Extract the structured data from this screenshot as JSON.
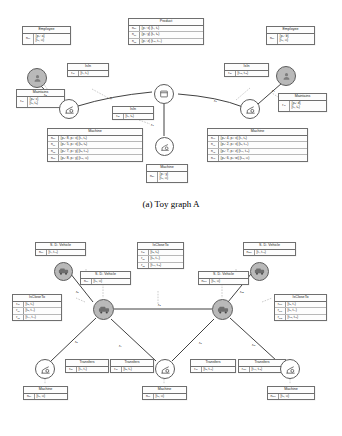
{
  "figure": {
    "caption_a": "(a) Toy graph A",
    "caption_b": "(b) Toy graph B"
  },
  "panel_a": {
    "boxes": {
      "employee_left": {
        "title": "Employee",
        "rows": [
          {
            "key_n": "n",
            "key_sub": "0",
            "key_sup": "0",
            "val": "{p₂: a}",
            "val2": "[t₀, ∞)"
          }
        ]
      },
      "product": {
        "title": "Product",
        "rows": [
          {
            "key_n": "n",
            "key_sub": "3",
            "key_sup": "0",
            "val": "{p₁: x} [t₁, t₇)"
          },
          {
            "key_n": "n",
            "key_sub": "3",
            "key_sup": "1",
            "val": "{p₁: y} [t₇, t₈)"
          },
          {
            "key_n": "n",
            "key_sub": "3",
            "key_sup": "2",
            "val": "{p₁: z} [t₁₃, t₁₄)"
          }
        ]
      },
      "employee_right": {
        "title": "Employee",
        "rows": [
          {
            "key_n": "n",
            "key_sub": "5",
            "key_sup": "0",
            "val": "{p₂: b}",
            "val2": "[t₀, ∞)"
          }
        ]
      },
      "isin_left": {
        "title": "IsIn",
        "rows": [
          {
            "key_n": "r",
            "key_sub": "1",
            "key_sup": "0",
            "val": "[t₁, t₇)"
          }
        ]
      },
      "isin_right": {
        "title": "IsIn",
        "rows": [
          {
            "key_n": "r",
            "key_sub": "3",
            "key_sup": "0",
            "val": "[t₁₃, t₁₅)"
          }
        ]
      },
      "isin_mid": {
        "title": "IsIn",
        "rows": [
          {
            "key_n": "r",
            "key_sub": "2",
            "key_sup": "0",
            "val": "[t₇, t₈)"
          }
        ]
      },
      "maintains_left": {
        "title": "Maintains",
        "rows": [
          {
            "key_n": "r",
            "key_sub": "0",
            "key_sup": "0",
            "val": "{p₃: c}",
            "val2": "[t₆, t₈)"
          }
        ]
      },
      "maintains_right": {
        "title": "Maintains",
        "rows": [
          {
            "key_n": "r",
            "key_sub": "4",
            "key_sup": "0",
            "val": "{p₃: d}",
            "val2": "[t₇, t₈)"
          }
        ]
      },
      "machine_left": {
        "title": "Machine",
        "rows": [
          {
            "key_n": "n",
            "key_sub": "1",
            "key_sup": "0",
            "val": "{p₀: 8, p₁: x} [t₁, t₆)"
          },
          {
            "key_n": "n",
            "key_sub": "1",
            "key_sup": "1",
            "val": "{p₀: 5, p₁: x} [t₆, t₈)"
          },
          {
            "key_n": "n",
            "key_sub": "1",
            "key_sup": "2",
            "val": "{p₀: 7, p₁: y} [t₈, t₁₆)"
          },
          {
            "key_n": "n",
            "key_sub": "1",
            "key_sup": "3",
            "val": "{p₀: 8, p₁: y} [t₁₆, ∞)"
          }
        ]
      },
      "machine_mid": {
        "title": "Machine",
        "rows": [
          {
            "key_n": "n",
            "key_sub": "2",
            "key_sup": "0",
            "val": "{p₁: y}",
            "val2": "[t₀, ∞)"
          }
        ]
      },
      "machine_right": {
        "title": "Machine",
        "rows": [
          {
            "key_n": "n",
            "key_sub": "4",
            "key_sup": "0",
            "val": "{p₀: 4, p₁: x} [t₁, t₆)"
          },
          {
            "key_n": "n",
            "key_sub": "4",
            "key_sup": "1",
            "val": "{p₀: 2, p₁: x} [t₆, t₁₂)"
          },
          {
            "key_n": "n",
            "key_sub": "4",
            "key_sup": "2",
            "val": "{p₀: 7, p₁: z} [t₁₂, t₁₆)"
          },
          {
            "key_n": "n",
            "key_sub": "4",
            "key_sup": "3",
            "val": "{p₀: 6, p₂: w} [t₁₆, ∞)"
          }
        ]
      }
    },
    "edge_labels": [
      "r₀",
      "r₁",
      "r₂",
      "r₃",
      "r₄"
    ],
    "nodes": [
      {
        "name": "employee-node-left",
        "icon": "person-icon",
        "fill": "grey"
      },
      {
        "name": "employee-node-right",
        "icon": "person-icon",
        "fill": "grey"
      },
      {
        "name": "machine-node-left",
        "icon": "machine-icon",
        "fill": "white"
      },
      {
        "name": "machine-node-mid",
        "icon": "machine-icon",
        "fill": "white"
      },
      {
        "name": "machine-node-right",
        "icon": "machine-icon",
        "fill": "white"
      },
      {
        "name": "product-node",
        "icon": "product-icon",
        "fill": "white"
      }
    ]
  },
  "panel_b": {
    "boxes": {
      "sdv_7": {
        "title": "S. D. Vehicle",
        "rows": [
          {
            "key_n": "n",
            "key_sub": "7",
            "key_sup": "0",
            "val": "[t₁, t₁₆)"
          }
        ]
      },
      "sdv_6": {
        "title": "S. D. Vehicle",
        "rows": [
          {
            "key_n": "n",
            "key_sub": "6",
            "key_sup": "0",
            "val": "[t₀, ∞)"
          }
        ]
      },
      "sdv_10": {
        "title": "S. D. Vehicle",
        "rows": [
          {
            "key_n": "n",
            "key_sub": "10",
            "key_sup": "0",
            "val": "[t₀, ∞)"
          }
        ]
      },
      "sdv_12": {
        "title": "S. D. Vehicle",
        "rows": [
          {
            "key_n": "n",
            "key_sub": "12",
            "key_sup": "0",
            "val": "[t₁, t₁₆)"
          }
        ]
      },
      "isclose_6": {
        "title": "IsCloseTo",
        "rows": [
          {
            "key_n": "r",
            "key_sub": "6",
            "key_sup": "0",
            "val": "[t₃, t₇)"
          },
          {
            "key_n": "r",
            "key_sub": "6",
            "key_sup": "1",
            "val": "[t₈, t₁₁)"
          },
          {
            "key_n": "r",
            "key_sub": "6",
            "key_sup": "2",
            "val": "[t₁₁, t₁₄)"
          }
        ]
      },
      "isclose_8": {
        "title": "IsCloseTo",
        "rows": [
          {
            "key_n": "r",
            "key_sub": "8",
            "key_sup": "0",
            "val": "[t₃, t₆)"
          },
          {
            "key_n": "r",
            "key_sub": "8",
            "key_sup": "1",
            "val": "[t₆, t₁₁)"
          },
          {
            "key_n": "r",
            "key_sub": "8",
            "key_sup": "2",
            "val": "[t₁₂, t₁₅)"
          }
        ]
      },
      "isclose_10": {
        "title": "IsCloseTo",
        "rows": [
          {
            "key_n": "r",
            "key_sub": "10",
            "key_sup": "0",
            "val": "[t₃, t₄)"
          },
          {
            "key_n": "r",
            "key_sub": "10",
            "key_sup": "1",
            "val": "[t₆, t₁₁)"
          },
          {
            "key_n": "r",
            "key_sub": "10",
            "key_sup": "2",
            "val": "[t₁₃, t₁₆)"
          }
        ]
      },
      "transfers_5": {
        "title": "Transfers",
        "rows": [
          {
            "key_n": "r",
            "key_sub": "5",
            "key_sup": "0",
            "val": "[t₂, t₄)"
          }
        ]
      },
      "transfers_7": {
        "title": "Transfers",
        "rows": [
          {
            "key_n": "r",
            "key_sub": "7",
            "key_sup": "0",
            "val": "[t₅, t₇)"
          }
        ]
      },
      "transfers_9": {
        "title": "Transfers",
        "rows": [
          {
            "key_n": "r",
            "key_sub": "9",
            "key_sup": "0",
            "val": "[t₈, t₁₀)"
          }
        ]
      },
      "transfers_11": {
        "title": "Transfers",
        "rows": [
          {
            "key_n": "r",
            "key_sub": "11",
            "key_sup": "0",
            "val": "[t₁₂, t₁₃)"
          }
        ]
      },
      "machine_5": {
        "title": "Machine",
        "rows": [
          {
            "key_n": "n",
            "key_sub": "5",
            "key_sup": "0",
            "val": "[t₀, ∞)"
          }
        ]
      },
      "machine_9": {
        "title": "Machine",
        "rows": [
          {
            "key_n": "n",
            "key_sub": "9",
            "key_sup": "0",
            "val": "[t₀, ∞)"
          }
        ]
      },
      "machine_11": {
        "title": "Machine",
        "rows": [
          {
            "key_n": "n",
            "key_sub": "11",
            "key_sup": "0",
            "val": "[t₀, ∞)"
          }
        ]
      }
    },
    "edge_labels": [
      "r₆",
      "r₅",
      "r₇",
      "r₈",
      "r₉",
      "r₁₀",
      "r₁₁"
    ],
    "nodes": [
      {
        "name": "vehicle-node-7",
        "icon": "vehicle-icon",
        "fill": "grey"
      },
      {
        "name": "vehicle-node-6",
        "icon": "vehicle-icon",
        "fill": "grey"
      },
      {
        "name": "vehicle-node-10",
        "icon": "vehicle-icon",
        "fill": "grey"
      },
      {
        "name": "vehicle-node-12",
        "icon": "vehicle-icon",
        "fill": "grey"
      },
      {
        "name": "machine-node-5",
        "icon": "machine-icon",
        "fill": "white"
      },
      {
        "name": "machine-node-9",
        "icon": "machine-icon",
        "fill": "white"
      },
      {
        "name": "machine-node-11",
        "icon": "machine-icon",
        "fill": "white"
      }
    ]
  },
  "colors": {
    "node_grey": "#b9b9b9",
    "node_white": "#ffffff",
    "border": "#6f6f6f",
    "edge": "#2b2b2b"
  }
}
